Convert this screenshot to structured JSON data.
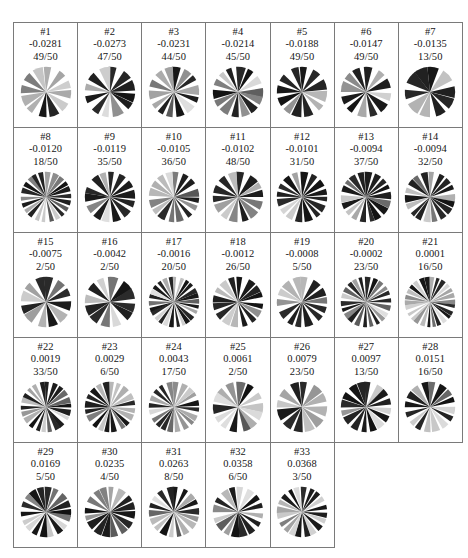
{
  "figure": {
    "title": "",
    "columns": 7,
    "rows": 5,
    "total_cells": 33,
    "count_denominator": 50
  },
  "chart_data": {
    "type": "table",
    "title": "",
    "xlabel": "",
    "ylabel": "",
    "columns": [
      "index",
      "value",
      "count"
    ],
    "grid_columns": 7,
    "grid_rows": 5,
    "series": [
      {
        "name": "value",
        "values": [
          -0.0281,
          -0.0273,
          -0.0231,
          -0.0214,
          -0.0188,
          -0.0147,
          -0.0135,
          -0.012,
          -0.0119,
          -0.0105,
          -0.0102,
          -0.0101,
          -0.0094,
          -0.0094,
          -0.0075,
          -0.0042,
          -0.0016,
          -0.0012,
          -0.0008,
          -0.0002,
          0.0001,
          0.0019,
          0.0029,
          0.0043,
          0.0061,
          0.0079,
          0.0097,
          0.0151,
          0.0169,
          0.0235,
          0.0263,
          0.0358,
          0.0368
        ]
      },
      {
        "name": "count",
        "values": [
          49,
          47,
          44,
          45,
          49,
          49,
          13,
          18,
          35,
          36,
          48,
          31,
          37,
          32,
          2,
          2,
          20,
          26,
          5,
          23,
          16,
          33,
          6,
          17,
          2,
          23,
          13,
          16,
          5,
          4,
          8,
          6,
          3
        ]
      }
    ],
    "categories": [
      "#1",
      "#2",
      "#3",
      "#4",
      "#5",
      "#6",
      "#7",
      "#8",
      "#9",
      "#10",
      "#11",
      "#12",
      "#13",
      "#14",
      "#15",
      "#16",
      "#17",
      "#18",
      "#19",
      "#20",
      "#21",
      "#22",
      "#23",
      "#24",
      "#25",
      "#26",
      "#27",
      "#28",
      "#29",
      "#30",
      "#31",
      "#32",
      "#33"
    ]
  },
  "cells": [
    {
      "id": "#1",
      "value": "-0.0281",
      "count": "49/50",
      "wedges": 12,
      "seed": 11,
      "contrast": 0.92,
      "bias": 0.18
    },
    {
      "id": "#2",
      "value": "-0.0273",
      "count": "47/50",
      "wedges": 12,
      "seed": 27,
      "contrast": 0.95,
      "bias": 0.22
    },
    {
      "id": "#3",
      "value": "-0.0231",
      "count": "44/50",
      "wedges": 14,
      "seed": 43,
      "contrast": 0.85,
      "bias": 0.3
    },
    {
      "id": "#4",
      "value": "-0.0214",
      "count": "45/50",
      "wedges": 14,
      "seed": 59,
      "contrast": 0.88,
      "bias": 0.28
    },
    {
      "id": "#5",
      "value": "-0.0188",
      "count": "49/50",
      "wedges": 12,
      "seed": 71,
      "contrast": 0.9,
      "bias": 0.2
    },
    {
      "id": "#6",
      "value": "-0.0147",
      "count": "49/50",
      "wedges": 12,
      "seed": 89,
      "contrast": 0.93,
      "bias": 0.16
    },
    {
      "id": "#7",
      "value": "-0.0135",
      "count": "13/50",
      "wedges": 10,
      "seed": 101,
      "contrast": 0.97,
      "bias": 0.12
    },
    {
      "id": "#8",
      "value": "-0.0120",
      "count": "18/50",
      "wedges": 22,
      "seed": 113,
      "contrast": 0.8,
      "bias": 0.42
    },
    {
      "id": "#9",
      "value": "-0.0119",
      "count": "35/50",
      "wedges": 14,
      "seed": 131,
      "contrast": 0.72,
      "bias": 0.46
    },
    {
      "id": "#10",
      "value": "-0.0105",
      "count": "36/50",
      "wedges": 16,
      "seed": 149,
      "contrast": 0.82,
      "bias": 0.34
    },
    {
      "id": "#11",
      "value": "-0.0102",
      "count": "48/50",
      "wedges": 14,
      "seed": 163,
      "contrast": 0.9,
      "bias": 0.3
    },
    {
      "id": "#12",
      "value": "-0.0101",
      "count": "31/50",
      "wedges": 16,
      "seed": 179,
      "contrast": 0.94,
      "bias": 0.2
    },
    {
      "id": "#13",
      "value": "-0.0094",
      "count": "37/50",
      "wedges": 18,
      "seed": 191,
      "contrast": 0.78,
      "bias": 0.3
    },
    {
      "id": "#14",
      "value": "-0.0094",
      "count": "32/50",
      "wedges": 18,
      "seed": 211,
      "contrast": 0.76,
      "bias": 0.34
    },
    {
      "id": "#15",
      "value": "-0.0075",
      "count": "2/50",
      "wedges": 12,
      "seed": 227,
      "contrast": 0.86,
      "bias": 0.28
    },
    {
      "id": "#16",
      "value": "-0.0042",
      "count": "2/50",
      "wedges": 12,
      "seed": 241,
      "contrast": 0.9,
      "bias": 0.24
    },
    {
      "id": "#17",
      "value": "-0.0016",
      "count": "20/50",
      "wedges": 26,
      "seed": 257,
      "contrast": 0.64,
      "bias": 0.4
    },
    {
      "id": "#18",
      "value": "-0.0012",
      "count": "26/50",
      "wedges": 16,
      "seed": 269,
      "contrast": 0.88,
      "bias": 0.26
    },
    {
      "id": "#19",
      "value": "-0.0008",
      "count": "5/50",
      "wedges": 14,
      "seed": 283,
      "contrast": 0.8,
      "bias": 0.32
    },
    {
      "id": "#20",
      "value": "-0.0002",
      "count": "23/50",
      "wedges": 22,
      "seed": 307,
      "contrast": 0.5,
      "bias": 0.74
    },
    {
      "id": "#21",
      "value": "0.0001",
      "count": "16/50",
      "wedges": 26,
      "seed": 313,
      "contrast": 0.7,
      "bias": 0.3
    },
    {
      "id": "#22",
      "value": "0.0019",
      "count": "33/50",
      "wedges": 22,
      "seed": 331,
      "contrast": 0.84,
      "bias": 0.26
    },
    {
      "id": "#23",
      "value": "0.0029",
      "count": "6/50",
      "wedges": 20,
      "seed": 347,
      "contrast": 0.86,
      "bias": 0.24
    },
    {
      "id": "#24",
      "value": "0.0043",
      "count": "17/50",
      "wedges": 20,
      "seed": 359,
      "contrast": 0.82,
      "bias": 0.28
    },
    {
      "id": "#25",
      "value": "0.0061",
      "count": "2/50",
      "wedges": 14,
      "seed": 373,
      "contrast": 0.74,
      "bias": 0.4
    },
    {
      "id": "#26",
      "value": "0.0079",
      "count": "23/50",
      "wedges": 12,
      "seed": 389,
      "contrast": 0.95,
      "bias": 0.14
    },
    {
      "id": "#27",
      "value": "0.0097",
      "count": "13/50",
      "wedges": 16,
      "seed": 401,
      "contrast": 0.92,
      "bias": 0.18
    },
    {
      "id": "#28",
      "value": "0.0151",
      "count": "16/50",
      "wedges": 16,
      "seed": 419,
      "contrast": 0.9,
      "bias": 0.2
    },
    {
      "id": "#29",
      "value": "0.0169",
      "count": "5/50",
      "wedges": 18,
      "seed": 433,
      "contrast": 0.8,
      "bias": 0.32
    },
    {
      "id": "#30",
      "value": "0.0235",
      "count": "4/50",
      "wedges": 16,
      "seed": 449,
      "contrast": 0.78,
      "bias": 0.36
    },
    {
      "id": "#31",
      "value": "0.0263",
      "count": "8/50",
      "wedges": 18,
      "seed": 463,
      "contrast": 0.82,
      "bias": 0.3
    },
    {
      "id": "#32",
      "value": "0.0358",
      "count": "6/50",
      "wedges": 16,
      "seed": 479,
      "contrast": 0.84,
      "bias": 0.28
    },
    {
      "id": "#33",
      "value": "0.0368",
      "count": "3/50",
      "wedges": 20,
      "seed": 491,
      "contrast": 0.86,
      "bias": 0.26
    }
  ],
  "colors": {
    "border": "#7a7a7a",
    "text": "#161616",
    "background": "#ffffff",
    "glyph_dark": "#1c1c1c",
    "glyph_light": "#f2f2f2"
  }
}
